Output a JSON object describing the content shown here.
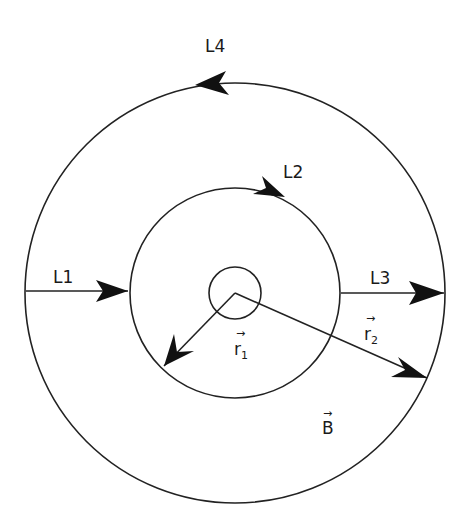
{
  "diagram": {
    "type": "concentric-circles-ampere-loops",
    "center": [
      235,
      293
    ],
    "circles": [
      {
        "name": "small-core-circle",
        "r": 26
      },
      {
        "name": "inner-circle",
        "r": 105
      },
      {
        "name": "outer-circle",
        "r": 210
      }
    ],
    "labels": {
      "L1": "L1",
      "L2": "L2",
      "L3": "L3",
      "L4": "L4",
      "r1_main": "r",
      "r1_sub": "1",
      "r2_main": "r",
      "r2_sub": "2",
      "B": "B",
      "vector_arrow": "→"
    },
    "paths": {
      "L1": "horizontal segment from outer circle (left) to inner circle, arrow pointing right",
      "L2": "arc along inner circle near top, arrow clockwise",
      "L3": "horizontal segment from inner circle (right) to outer circle, arrow pointing right",
      "L4": "arc along outer circle at top, arrow counter-clockwise",
      "r1": "vector from center to inner circle, lower-left direction",
      "r2": "vector from center to outer circle, lower-right direction"
    },
    "colors": {
      "stroke": "#222222",
      "arrow": "#111111",
      "background": "#ffffff"
    }
  }
}
